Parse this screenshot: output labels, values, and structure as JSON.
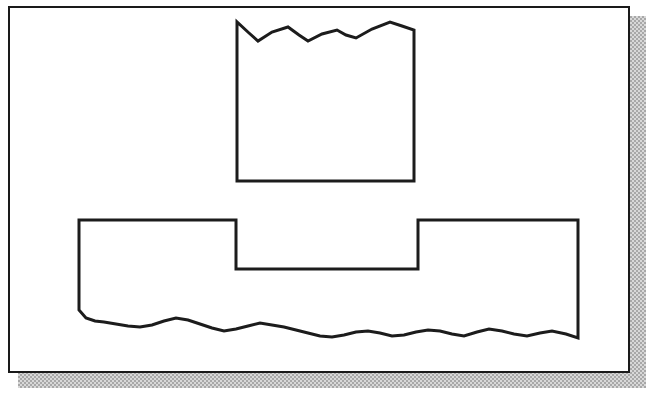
{
  "document": {
    "title": "Schematic line drawing",
    "caption": "",
    "background_color": "#ffffff"
  },
  "frame": {
    "name": "figure-frame",
    "x": 8,
    "y": 6,
    "width": 622,
    "height": 367,
    "border_color": "#1a1a1a",
    "border_width": 2,
    "fill_color": "#ffffff"
  },
  "shadow": {
    "name": "drop-shadow",
    "x": 18,
    "y": 16,
    "width": 628,
    "height": 372,
    "color": "#a8a8a8",
    "pattern": "dither-50"
  },
  "shapes": [
    {
      "id": "upper-shape",
      "name": "torn-top-rectangle",
      "description": "Rectangle with a jagged zig-zag top edge",
      "stroke_color": "#1c1c1c",
      "stroke_width": 3,
      "fill": "none",
      "bounds": {
        "x": 237,
        "y": 21,
        "width": 177,
        "height": 161
      },
      "points": [
        [
          237,
          181
        ],
        [
          237,
          22
        ],
        [
          249,
          33
        ],
        [
          258,
          41
        ],
        [
          272,
          32
        ],
        [
          288,
          27
        ],
        [
          299,
          35
        ],
        [
          308,
          41
        ],
        [
          322,
          34
        ],
        [
          337,
          30
        ],
        [
          346,
          35
        ],
        [
          356,
          38
        ],
        [
          372,
          29
        ],
        [
          390,
          22
        ],
        [
          402,
          26
        ],
        [
          414,
          30
        ],
        [
          414,
          181
        ],
        [
          237,
          181
        ]
      ]
    },
    {
      "id": "lower-shape",
      "name": "stepped-wavy-base-shape",
      "description": "Wide shape with a notched stepped top and an irregular wavy bottom edge",
      "stroke_color": "#1c1c1c",
      "stroke_width": 3,
      "fill": "none",
      "bounds": {
        "x": 79,
        "y": 220,
        "width": 499,
        "height": 121
      },
      "points": [
        [
          79,
          220
        ],
        [
          236,
          220
        ],
        [
          236,
          269
        ],
        [
          418,
          269
        ],
        [
          418,
          220
        ],
        [
          578,
          220
        ],
        [
          578,
          338
        ],
        [
          566,
          334
        ],
        [
          552,
          331
        ],
        [
          540,
          333
        ],
        [
          527,
          336
        ],
        [
          514,
          334
        ],
        [
          502,
          331
        ],
        [
          489,
          329
        ],
        [
          477,
          332
        ],
        [
          464,
          336
        ],
        [
          452,
          334
        ],
        [
          440,
          331
        ],
        [
          428,
          330
        ],
        [
          416,
          332
        ],
        [
          404,
          335
        ],
        [
          392,
          336
        ],
        [
          380,
          333
        ],
        [
          368,
          331
        ],
        [
          356,
          332
        ],
        [
          344,
          335
        ],
        [
          332,
          337
        ],
        [
          320,
          336
        ],
        [
          308,
          333
        ],
        [
          296,
          330
        ],
        [
          284,
          327
        ],
        [
          272,
          325
        ],
        [
          260,
          323
        ],
        [
          248,
          326
        ],
        [
          236,
          329
        ],
        [
          224,
          331
        ],
        [
          212,
          328
        ],
        [
          200,
          324
        ],
        [
          188,
          320
        ],
        [
          176,
          318
        ],
        [
          164,
          321
        ],
        [
          152,
          325
        ],
        [
          140,
          327
        ],
        [
          128,
          326
        ],
        [
          116,
          324
        ],
        [
          104,
          322
        ],
        [
          95,
          321
        ],
        [
          86,
          318
        ],
        [
          79,
          310
        ],
        [
          79,
          220
        ]
      ]
    }
  ]
}
